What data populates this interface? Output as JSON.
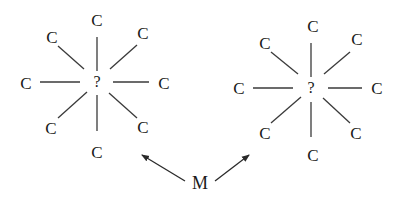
{
  "diagram": {
    "title": "",
    "colors": {
      "background": "#ffffff",
      "ink": "#1a1a1a",
      "line": "#3a3a3a"
    },
    "left_cluster": {
      "center_label": "?",
      "center": [
        97,
        82
      ],
      "atoms": [
        {
          "label": "C",
          "position": "top",
          "x": 97,
          "y": 20
        },
        {
          "label": "C",
          "position": "top-right",
          "x": 143,
          "y": 33
        },
        {
          "label": "C",
          "position": "right",
          "x": 164,
          "y": 83
        },
        {
          "label": "C",
          "position": "bottom-right",
          "x": 143,
          "y": 127
        },
        {
          "label": "C",
          "position": "bottom",
          "x": 97,
          "y": 152
        },
        {
          "label": "C",
          "position": "bottom-left",
          "x": 51,
          "y": 128
        },
        {
          "label": "C",
          "position": "left",
          "x": 26,
          "y": 82
        },
        {
          "label": "C",
          "position": "top-left",
          "x": 52,
          "y": 37
        }
      ]
    },
    "right_cluster": {
      "center_label": "?",
      "center": [
        311,
        88
      ],
      "atoms": [
        {
          "label": "C",
          "position": "top",
          "x": 313,
          "y": 26
        },
        {
          "label": "C",
          "position": "top-right",
          "x": 357,
          "y": 39
        },
        {
          "label": "C",
          "position": "right",
          "x": 377,
          "y": 88
        },
        {
          "label": "C",
          "position": "bottom-right",
          "x": 356,
          "y": 133
        },
        {
          "label": "C",
          "position": "bottom",
          "x": 313,
          "y": 155
        },
        {
          "label": "C",
          "position": "bottom-left",
          "x": 265,
          "y": 133
        },
        {
          "label": "C",
          "position": "left",
          "x": 239,
          "y": 88
        },
        {
          "label": "C",
          "position": "top-left",
          "x": 265,
          "y": 43
        }
      ]
    },
    "metal_label": {
      "label": "M",
      "x": 206,
      "y": 183
    },
    "arrows": [
      {
        "from": "M",
        "to": "left_cluster",
        "x1": 185,
        "y1": 181,
        "x2": 141,
        "y2": 154
      },
      {
        "from": "M",
        "to": "right_cluster",
        "x1": 215,
        "y1": 181,
        "x2": 249,
        "y2": 155
      }
    ]
  }
}
